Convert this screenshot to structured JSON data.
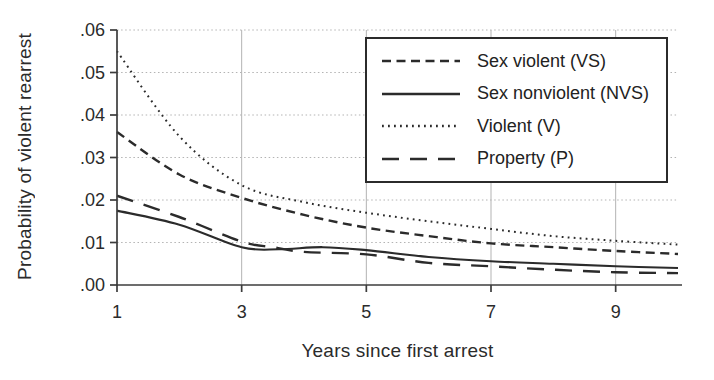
{
  "chart_data": {
    "type": "line",
    "title": "",
    "xlabel": "Years since first arrest",
    "ylabel": "Probability of violent rearrest",
    "xlim": [
      1,
      10
    ],
    "ylim": [
      0,
      0.06
    ],
    "grid": true,
    "legend_position": "top-right",
    "x_ticks": [
      {
        "value": 1,
        "label": "1"
      },
      {
        "value": 3,
        "label": "3"
      },
      {
        "value": 5,
        "label": "5"
      },
      {
        "value": 7,
        "label": "7"
      },
      {
        "value": 9,
        "label": "9"
      }
    ],
    "y_ticks": [
      {
        "value": 0.0,
        "label": ".00"
      },
      {
        "value": 0.01,
        "label": ".01"
      },
      {
        "value": 0.02,
        "label": ".02"
      },
      {
        "value": 0.03,
        "label": ".03"
      },
      {
        "value": 0.04,
        "label": ".04"
      },
      {
        "value": 0.05,
        "label": ".05"
      },
      {
        "value": 0.06,
        "label": ".06"
      }
    ],
    "series": [
      {
        "name": "Sex violent (VS)",
        "line_style": "short-dash",
        "x": [
          1,
          2,
          3,
          4,
          5,
          6,
          7,
          8,
          9,
          10
        ],
        "y": [
          0.036,
          0.026,
          0.0205,
          0.0165,
          0.0135,
          0.0115,
          0.0098,
          0.0089,
          0.008,
          0.0073
        ]
      },
      {
        "name": "Sex nonviolent (NVS)",
        "line_style": "solid",
        "x": [
          1,
          2,
          3,
          3.6,
          4.3,
          5,
          6,
          7,
          8,
          9,
          10
        ],
        "y": [
          0.0175,
          0.0142,
          0.0089,
          0.0084,
          0.0089,
          0.0082,
          0.0066,
          0.0056,
          0.005,
          0.0044,
          0.004
        ]
      },
      {
        "name": "Violent (V)",
        "line_style": "dotted",
        "x": [
          1,
          2,
          3,
          4,
          5,
          6,
          7,
          8,
          9,
          10
        ],
        "y": [
          0.055,
          0.035,
          0.0235,
          0.0195,
          0.017,
          0.015,
          0.0132,
          0.0115,
          0.0104,
          0.0095
        ]
      },
      {
        "name": "Property (P)",
        "line_style": "long-dash",
        "x": [
          1,
          2,
          3,
          3.5,
          4,
          5,
          6,
          7,
          8,
          9,
          10
        ],
        "y": [
          0.021,
          0.016,
          0.0102,
          0.0089,
          0.0078,
          0.0072,
          0.0052,
          0.0044,
          0.0036,
          0.003,
          0.0028
        ]
      }
    ]
  },
  "colors": {
    "line": "#2b2b2b",
    "grid": "#b3b3b3",
    "axis": "#3c3c3c",
    "text": "#2b2b2b",
    "background": "#ffffff"
  }
}
